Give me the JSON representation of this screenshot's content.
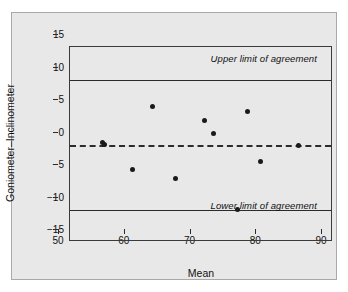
{
  "chart_data": {
    "type": "scatter",
    "title": "",
    "xlabel": "Mean",
    "ylabel": "Goniometer–Inclinometer",
    "xlim": [
      50,
      90
    ],
    "ylim": [
      -15,
      15
    ],
    "xticks": [
      50,
      60,
      70,
      80,
      90
    ],
    "yticks": [
      15,
      10,
      5,
      0,
      -5,
      -10,
      -15
    ],
    "xtick_labels": [
      "50",
      "60",
      "70",
      "80",
      "90"
    ],
    "ytick_labels": [
      "15",
      "10",
      "5",
      "0",
      "−5",
      "−10",
      "−15"
    ],
    "grid": false,
    "legend": null,
    "points": [
      {
        "x": 55.0,
        "y": 0.3
      },
      {
        "x": 55.3,
        "y": 0.0
      },
      {
        "x": 59.5,
        "y": -3.8
      },
      {
        "x": 62.5,
        "y": 5.9
      },
      {
        "x": 66.0,
        "y": -5.2
      },
      {
        "x": 70.5,
        "y": 3.7
      },
      {
        "x": 71.8,
        "y": 1.7
      },
      {
        "x": 75.4,
        "y": -10.0
      },
      {
        "x": 77.0,
        "y": 5.1
      },
      {
        "x": 79.0,
        "y": -2.6
      },
      {
        "x": 84.8,
        "y": -0.1
      }
    ],
    "reference_lines": [
      {
        "name": "upper-limit-of-agreement",
        "value": 10,
        "style": "solid",
        "label": "Upper limit of agreement",
        "label_position": "above-right"
      },
      {
        "name": "mean-difference",
        "value": 0,
        "style": "dashed",
        "label": "",
        "label_position": ""
      },
      {
        "name": "lower-limit-of-agreement",
        "value": -10,
        "style": "solid",
        "label": "Lower limit of agreement",
        "label_position": "below-right"
      }
    ],
    "colors": {
      "point": "#1a1a1a",
      "line": "#2b2b2b",
      "axis": "#3a3a3a",
      "panel_background": "#e8e8e8",
      "page_background": "#ffffff"
    }
  }
}
